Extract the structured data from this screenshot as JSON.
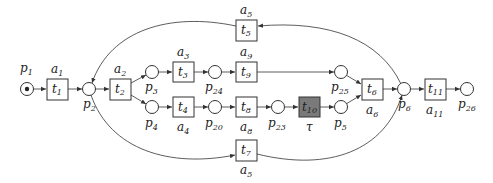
{
  "diagram": {
    "type": "petri-net",
    "colors": {
      "stroke": "#333333",
      "silent_transition_fill": "#7a7a7a",
      "background": "#ffffff"
    },
    "places": [
      {
        "id": "p1",
        "label": "p",
        "sub": "1",
        "x": 27,
        "y": 89,
        "token": true,
        "lx": 20,
        "ly": 72
      },
      {
        "id": "p2",
        "label": "p",
        "sub": "2",
        "x": 89,
        "y": 89,
        "lx": 83,
        "ly": 108
      },
      {
        "id": "p3",
        "label": "p",
        "sub": "3",
        "x": 152,
        "y": 72,
        "lx": 145,
        "ly": 91
      },
      {
        "id": "p4",
        "label": "p",
        "sub": "4",
        "x": 152,
        "y": 107,
        "lx": 145,
        "ly": 127
      },
      {
        "id": "p24",
        "label": "p",
        "sub": "24",
        "x": 215,
        "y": 72,
        "lx": 205,
        "ly": 91
      },
      {
        "id": "p20",
        "label": "p",
        "sub": "20",
        "x": 215,
        "y": 107,
        "lx": 205,
        "ly": 127
      },
      {
        "id": "p23",
        "label": "p",
        "sub": "23",
        "x": 278,
        "y": 107,
        "lx": 268,
        "ly": 127
      },
      {
        "id": "p25",
        "label": "p",
        "sub": "25",
        "x": 341,
        "y": 72,
        "lx": 331,
        "ly": 91
      },
      {
        "id": "p5",
        "label": "p",
        "sub": "5",
        "x": 341,
        "y": 107,
        "lx": 334,
        "ly": 127
      },
      {
        "id": "p6",
        "label": "p",
        "sub": "6",
        "x": 404,
        "y": 89,
        "lx": 398,
        "ly": 108
      },
      {
        "id": "p26",
        "label": "p",
        "sub": "26",
        "x": 467,
        "y": 89,
        "lx": 458,
        "ly": 108
      }
    ],
    "transitions": [
      {
        "id": "t1",
        "label": "t",
        "sub": "1",
        "x": 47,
        "y": 79,
        "action": "a",
        "action_sub": "1",
        "ax": 51,
        "ay": 73
      },
      {
        "id": "t2",
        "label": "t",
        "sub": "2",
        "x": 110,
        "y": 79,
        "action": "a",
        "action_sub": "2",
        "ax": 114,
        "ay": 73
      },
      {
        "id": "t3",
        "label": "t",
        "sub": "3",
        "x": 173,
        "y": 62,
        "action": "a",
        "action_sub": "3",
        "ax": 177,
        "ay": 56
      },
      {
        "id": "t4",
        "label": "t",
        "sub": "4",
        "x": 173,
        "y": 97,
        "action": "a",
        "action_sub": "4",
        "ax": 177,
        "ay": 131
      },
      {
        "id": "t5",
        "label": "t",
        "sub": "5",
        "x": 236,
        "y": 20,
        "action": "a",
        "action_sub": "5",
        "ax": 240,
        "ay": 14
      },
      {
        "id": "t9",
        "label": "t",
        "sub": "9",
        "x": 236,
        "y": 62,
        "action": "a",
        "action_sub": "9",
        "ax": 240,
        "ay": 56
      },
      {
        "id": "t8",
        "label": "t",
        "sub": "8",
        "x": 236,
        "y": 97,
        "action": "a",
        "action_sub": "8",
        "ax": 240,
        "ay": 131
      },
      {
        "id": "t7",
        "label": "t",
        "sub": "7",
        "x": 236,
        "y": 140,
        "action": "a",
        "action_sub": "5",
        "ax": 240,
        "ay": 174
      },
      {
        "id": "t10",
        "label": "t",
        "sub": "10",
        "x": 299,
        "y": 97,
        "silent": true,
        "action": "τ",
        "action_sub": "",
        "ax": 306,
        "ay": 131
      },
      {
        "id": "t6",
        "label": "t",
        "sub": "6",
        "x": 362,
        "y": 79,
        "action": "a",
        "action_sub": "6",
        "ax": 366,
        "ay": 114
      },
      {
        "id": "t11",
        "label": "t",
        "sub": "11",
        "x": 425,
        "y": 79,
        "action": "a",
        "action_sub": "11",
        "ax": 426,
        "ay": 114
      }
    ]
  }
}
